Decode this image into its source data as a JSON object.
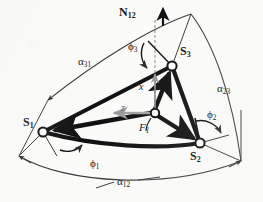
{
  "figure": {
    "kind": "geometry-diagram",
    "background_color": "#fbfbfa",
    "ink_color": "#111111",
    "axis_color": "#9a9a9a"
  },
  "nodes": [
    {
      "id": "S1",
      "label": "S",
      "sub": "1",
      "x": 42,
      "y": 132,
      "label_x": 24,
      "label_y": 118
    },
    {
      "id": "S2",
      "label": "S",
      "sub": "2",
      "x": 200,
      "y": 143,
      "label_x": 191,
      "label_y": 152
    },
    {
      "id": "S3",
      "label": "S",
      "sub": "3",
      "x": 172,
      "y": 66,
      "label_x": 180,
      "label_y": 48
    },
    {
      "id": "F1",
      "label": "F",
      "sub": "1",
      "x": 155,
      "y": 113,
      "label_x": 139,
      "label_y": 123
    }
  ],
  "vectors": {
    "normal": {
      "label": "N",
      "sub": "12",
      "label_x": 119,
      "label_y": 7,
      "tip_x": 163,
      "tip_y": 12
    },
    "axis_x": {
      "label": "x",
      "label_x": 139,
      "label_y": 85
    },
    "axis_z": {
      "label": "z",
      "label_x": 122,
      "label_y": 107
    }
  },
  "angles": {
    "phi1": {
      "label": "ϕ",
      "sub": "1",
      "label_x": 91,
      "label_y": 160
    },
    "phi2": {
      "label": "ϕ",
      "sub": "2",
      "label_x": 208,
      "label_y": 111
    },
    "phi3": {
      "label": "ϕ",
      "sub": "3",
      "label_x": 129,
      "label_y": 43
    },
    "alpha12": {
      "label": "α",
      "sub": "12",
      "label_x": 118,
      "label_y": 178
    },
    "alpha23": {
      "label": "α",
      "sub": "23",
      "label_x": 218,
      "label_y": 85
    },
    "alpha31": {
      "label": "α",
      "sub": "31",
      "label_x": 79,
      "label_y": 58
    }
  }
}
